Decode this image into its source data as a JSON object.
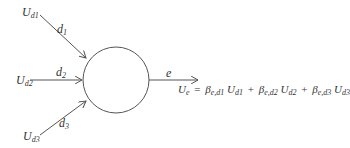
{
  "diagram": {
    "type": "node-with-inputs",
    "stroke_color": "#555555",
    "inputs": [
      {
        "source": "U",
        "source_sub": "d1",
        "edge_label": "d",
        "edge_sub": "1"
      },
      {
        "source": "U",
        "source_sub": "d2",
        "edge_label": "d",
        "edge_sub": "2"
      },
      {
        "source": "U",
        "source_sub": "d3",
        "edge_label": "d",
        "edge_sub": "3"
      }
    ],
    "output": {
      "edge_label": "e",
      "equation": {
        "lhs": "U",
        "lhs_sub": "e",
        "equals": "=",
        "terms": [
          {
            "coef": "β",
            "coef_sub": "e,d1",
            "var": "U",
            "var_sub": "d1"
          },
          {
            "coef": "β",
            "coef_sub": "e,d2",
            "var": "U",
            "var_sub": "d2"
          },
          {
            "coef": "β",
            "coef_sub": "e,d3",
            "var": "U",
            "var_sub": "d3"
          }
        ],
        "plus": "+"
      }
    }
  }
}
